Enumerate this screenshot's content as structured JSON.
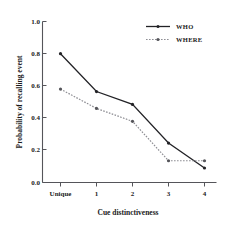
{
  "chart_data": {
    "type": "line",
    "title": "",
    "xlabel": "Cue distinctiveness",
    "ylabel": "Probability of recalling event",
    "categories": [
      "Unique",
      "1",
      "2",
      "3",
      "4"
    ],
    "xtick_labels": [
      "Unique",
      "1",
      "2",
      "3",
      "4"
    ],
    "ytick_labels": [
      "0.0",
      "0.2",
      "0.4",
      "0.6",
      "0.8",
      "1.0"
    ],
    "ytick_values": [
      0.0,
      0.2,
      0.4,
      0.6,
      0.8,
      1.0
    ],
    "ylim": [
      0.0,
      1.0
    ],
    "grid": false,
    "legend_position": "top-right",
    "series": [
      {
        "name": "WHO",
        "values": [
          0.8,
          0.565,
          0.485,
          0.245,
          0.09
        ],
        "color": "#222226",
        "line_style": "solid",
        "marker": "dot"
      },
      {
        "name": "WHERE",
        "values": [
          0.58,
          0.46,
          0.38,
          0.135,
          0.135
        ],
        "color": "#8e8e94",
        "line_style": "dotted",
        "marker": "dot"
      }
    ]
  },
  "legend": {
    "entries": [
      {
        "label": "WHO"
      },
      {
        "label": "WHERE"
      }
    ]
  },
  "axes": {
    "y_title": "Probability of recalling event",
    "x_title": "Cue distinctiveness",
    "y_ticks": [
      "1.0",
      "0.8",
      "0.6",
      "0.4",
      "0.2",
      "0.0"
    ],
    "x_ticks": [
      "Unique",
      "1",
      "2",
      "3",
      "4"
    ]
  }
}
